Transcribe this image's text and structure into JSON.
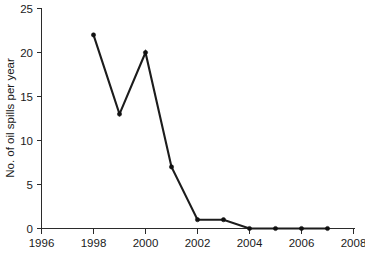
{
  "chart_data": {
    "type": "line",
    "title": "",
    "subtitle": "",
    "xlabel": "",
    "ylabel": "No. of oil spills per year",
    "x": [
      1998,
      1999,
      2000,
      2001,
      2002,
      2003,
      2004,
      2005,
      2006,
      2007
    ],
    "values": [
      22,
      13,
      20,
      7,
      1,
      1,
      0,
      0,
      0,
      0
    ],
    "series": [
      {
        "name": "No. of oil spills per year",
        "values": [
          22,
          13,
          20,
          7,
          1,
          1,
          0,
          0,
          0,
          0
        ]
      }
    ],
    "xlim": [
      1996,
      2008
    ],
    "ylim": [
      0,
      25
    ],
    "x_ticks": [
      1996,
      1998,
      2000,
      2002,
      2004,
      2006,
      2008
    ],
    "x_tick_labels": [
      "1996",
      "1998",
      "2000",
      "2002",
      "2004",
      "2006",
      "2008"
    ],
    "y_ticks": [
      0,
      5,
      10,
      15,
      20,
      25
    ],
    "y_tick_labels": [
      "0",
      "5",
      "10",
      "15",
      "20",
      "25"
    ],
    "grid": false,
    "legend": false,
    "legend_position": "none",
    "marker": "filled-circle",
    "line_color": "#1c1c1c",
    "marker_color": "#111111",
    "background_color": "#ffffff",
    "axis_color": "#2b2b2b"
  },
  "axes": {
    "y_axis_title": "No. of oil spills per year",
    "x_axis_title": ""
  }
}
